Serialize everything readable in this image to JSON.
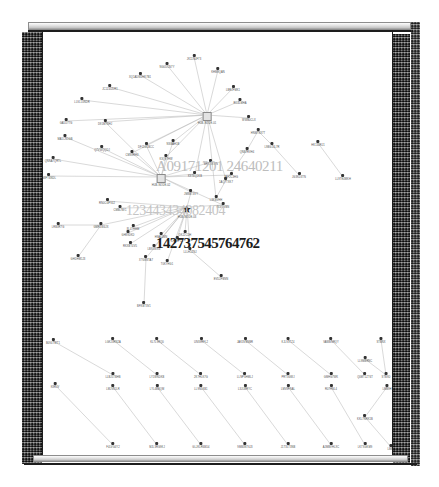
{
  "window": {
    "title": "Graph Visualization",
    "scrollbar_top_name": "horizontal-scrollbar-top",
    "scrollbar_bottom_name": "horizontal-scrollbar-bottom"
  },
  "watermarks": [
    {
      "id": "a",
      "text": "A09171201 24640211"
    },
    {
      "id": "b",
      "text": "123443434082404"
    },
    {
      "id": "c",
      "text": "142737545764762"
    }
  ],
  "graph": {
    "type": "node-link-diagram",
    "canvas": {
      "width": 351,
      "height": 423
    },
    "hubs": [
      {
        "id": "hub1",
        "glyph": "box",
        "x": 164,
        "y": 80,
        "label": "HUB-NODE-01"
      },
      {
        "id": "hub2",
        "glyph": "box",
        "x": 118,
        "y": 142,
        "label": "HUB-NODE-02"
      },
      {
        "id": "hub3",
        "glyph": "star",
        "x": 144,
        "y": 172,
        "label": "HUB-NODE-03"
      }
    ],
    "nodes": [
      {
        "id": "n01",
        "x": 124,
        "y": 30,
        "label": "NG0DCN7Y"
      },
      {
        "id": "n02",
        "x": 151,
        "y": 22,
        "label": "JK11N4F73"
      },
      {
        "id": "n03",
        "x": 97,
        "y": 40,
        "label": "XQ1ADW2HK7B1"
      },
      {
        "id": "n04",
        "x": 175,
        "y": 35,
        "label": "KHM9QAN"
      },
      {
        "id": "n05",
        "x": 67,
        "y": 52,
        "label": "JC1Z4UDR1"
      },
      {
        "id": "n06",
        "x": 190,
        "y": 53,
        "label": "LBRJFMK1"
      },
      {
        "id": "n07",
        "x": 39,
        "y": 65,
        "label": "LLVL10NDR"
      },
      {
        "id": "n08",
        "x": 197,
        "y": 66,
        "label": "RC4LMHA"
      },
      {
        "id": "n09",
        "x": 23,
        "y": 86,
        "label": "GA5D77G"
      },
      {
        "id": "n10",
        "x": 206,
        "y": 83,
        "label": "WWB0CLX"
      },
      {
        "id": "n11",
        "x": 62,
        "y": 87,
        "label": "D91M7NHJ"
      },
      {
        "id": "n12",
        "x": 22,
        "y": 102,
        "label": "MA1CN1GB"
      },
      {
        "id": "n13",
        "x": 130,
        "y": 107,
        "label": "NSBAH1B"
      },
      {
        "id": "n14",
        "x": 103,
        "y": 110,
        "label": "DFJ1G1BCC"
      },
      {
        "id": "n15",
        "x": 59,
        "y": 113,
        "label": "Q7VWQQDJ"
      },
      {
        "id": "n16",
        "x": 89,
        "y": 118,
        "label": "CMS9RH4"
      },
      {
        "id": "n17",
        "x": 123,
        "y": 122,
        "label": "K3Q9THW"
      },
      {
        "id": "n18",
        "x": 10,
        "y": 124,
        "label": "QNNA7QRTL"
      },
      {
        "id": "n19",
        "x": 168,
        "y": 127,
        "label": "BRKDXWN"
      },
      {
        "id": "n20",
        "x": 6,
        "y": 141,
        "label": "N8FT6NDL"
      },
      {
        "id": "n21",
        "x": 152,
        "y": 139,
        "label": "K9T6Q1KB"
      },
      {
        "id": "n22",
        "x": 188,
        "y": 140,
        "label": "JAF2C3HG"
      },
      {
        "id": "n23",
        "x": 148,
        "y": 157,
        "label": "JM8BT3VY"
      },
      {
        "id": "n24",
        "x": 64,
        "y": 166,
        "label": "RN0CGFV4J"
      },
      {
        "id": "n25",
        "x": 180,
        "y": 170,
        "label": "BLVDVBN"
      },
      {
        "id": "n26",
        "x": 77,
        "y": 173,
        "label": "CMBLNV1"
      },
      {
        "id": "n27",
        "x": 15,
        "y": 190,
        "label": "LRB3R7G"
      },
      {
        "id": "n28",
        "x": 58,
        "y": 190,
        "label": "GMR1W4JX"
      },
      {
        "id": "n29",
        "x": 90,
        "y": 192,
        "label": "8L47HHM"
      },
      {
        "id": "n30",
        "x": 85,
        "y": 198,
        "label": "GH89DKD"
      },
      {
        "id": "n31",
        "x": 142,
        "y": 198,
        "label": "DKJ2CDH"
      },
      {
        "id": "n32",
        "x": 118,
        "y": 200,
        "label": "H9A61MN"
      },
      {
        "id": "n33",
        "x": 134,
        "y": 204,
        "label": "CHK8P1Z"
      },
      {
        "id": "n34",
        "x": 87,
        "y": 209,
        "label": "RKXBT4V5"
      },
      {
        "id": "n35",
        "x": 111,
        "y": 212,
        "label": "LB91WXG"
      },
      {
        "id": "n36",
        "x": 147,
        "y": 215,
        "label": "LLLH1ZNJ"
      },
      {
        "id": "n37",
        "x": 103,
        "y": 223,
        "label": "XTG8STA7"
      },
      {
        "id": "n38",
        "x": 124,
        "y": 227,
        "label": "T0KYHG1"
      },
      {
        "id": "n39",
        "x": 35,
        "y": 222,
        "label": "GHDHM1J3"
      },
      {
        "id": "n40",
        "x": 178,
        "y": 242,
        "label": "EVD2FBNN"
      },
      {
        "id": "n41",
        "x": 101,
        "y": 269,
        "label": "BFXBT3V1"
      },
      {
        "id": "n42",
        "x": 215,
        "y": 96,
        "label": "HNMT8X7T"
      },
      {
        "id": "n43",
        "x": 229,
        "y": 110,
        "label": "L9BG13L7R"
      },
      {
        "id": "n44",
        "x": 204,
        "y": 115,
        "label": "QNB7RVH4"
      },
      {
        "id": "n45",
        "x": 183,
        "y": 145,
        "label": "1AQ7TXK7"
      },
      {
        "id": "n46",
        "x": 173,
        "y": 163,
        "label": "L3KBVHH"
      },
      {
        "id": "n47",
        "x": 256,
        "y": 140,
        "label": "JG3KD3TN"
      },
      {
        "id": "n48",
        "x": 275,
        "y": 108,
        "label": "HK134RJ1"
      },
      {
        "id": "n49",
        "x": 300,
        "y": 142,
        "label": "LL9TE4MKH"
      },
      {
        "id": "n50",
        "x": 10,
        "y": 306,
        "label": "B0V4TWT1"
      },
      {
        "id": "n51",
        "x": 70,
        "y": 305,
        "label": "LGKJ3RN2A"
      },
      {
        "id": "n52",
        "x": 114,
        "y": 305,
        "label": "KL7L9RQ0"
      },
      {
        "id": "n53",
        "x": 158,
        "y": 305,
        "label": "UNS9RFL2"
      },
      {
        "id": "n54",
        "x": 202,
        "y": 305,
        "label": "JAK3VBNBR"
      },
      {
        "id": "n55",
        "x": 245,
        "y": 305,
        "label": "KJLV3TZ4"
      },
      {
        "id": "n56",
        "x": 288,
        "y": 305,
        "label": "VAWBNRQY"
      },
      {
        "id": "n57",
        "x": 338,
        "y": 305,
        "label": "STBNX"
      },
      {
        "id": "n58",
        "x": 70,
        "y": 340,
        "label": "LLBJ5TBHB"
      },
      {
        "id": "n59",
        "x": 114,
        "y": 340,
        "label": "LY1WNDKB"
      },
      {
        "id": "n60",
        "x": 158,
        "y": 340,
        "label": "2K7HLK7G"
      },
      {
        "id": "n61",
        "x": 202,
        "y": 340,
        "label": "LLNPSHMLJ"
      },
      {
        "id": "n62",
        "x": 245,
        "y": 340,
        "label": "PRT3GWJ"
      },
      {
        "id": "n63",
        "x": 288,
        "y": 340,
        "label": "GMHG7WK"
      },
      {
        "id": "n64",
        "x": 322,
        "y": 324,
        "label": "LL9MBRNC"
      },
      {
        "id": "n65",
        "x": 322,
        "y": 340,
        "label": "Q0MT1ZT6T"
      },
      {
        "id": "n66",
        "x": 343,
        "y": 340,
        "label": "STB9D"
      },
      {
        "id": "n67",
        "x": 12,
        "y": 350,
        "label": "K8RJV"
      },
      {
        "id": "n68",
        "x": 70,
        "y": 352,
        "label": "LMJV8JLR"
      },
      {
        "id": "n69",
        "x": 114,
        "y": 352,
        "label": "LYL4BBQM"
      },
      {
        "id": "n70",
        "x": 158,
        "y": 352,
        "label": "LL9NLKB1"
      },
      {
        "id": "n71",
        "x": 202,
        "y": 352,
        "label": "L3JLWRYC"
      },
      {
        "id": "n72",
        "x": 245,
        "y": 352,
        "label": "LMV8FNAL"
      },
      {
        "id": "n73",
        "x": 288,
        "y": 352,
        "label": "R07HNL4"
      },
      {
        "id": "n74",
        "x": 344,
        "y": 352,
        "label": "LMB9H"
      },
      {
        "id": "n75",
        "x": 322,
        "y": 382,
        "label": "KKL7NRK1B"
      },
      {
        "id": "n76",
        "x": 70,
        "y": 410,
        "label": "F4LVG4Y2"
      },
      {
        "id": "n77",
        "x": 114,
        "y": 410,
        "label": "MJL3RG9KJ"
      },
      {
        "id": "n78",
        "x": 158,
        "y": 410,
        "label": "GLJKLR6BD4"
      },
      {
        "id": "n79",
        "x": 202,
        "y": 410,
        "label": "9MB3NT6J3"
      },
      {
        "id": "n80",
        "x": 245,
        "y": 410,
        "label": "J1T3LT3NB"
      },
      {
        "id": "n81",
        "x": 288,
        "y": 410,
        "label": "AJMBVHLXC"
      },
      {
        "id": "n82",
        "x": 322,
        "y": 410,
        "label": "LK7XGKM9"
      },
      {
        "id": "n83",
        "x": 348,
        "y": 412,
        "label": "LMB9"
      }
    ],
    "edges": [
      [
        "hub1",
        "n01"
      ],
      [
        "hub1",
        "n02"
      ],
      [
        "hub1",
        "n03"
      ],
      [
        "hub1",
        "n04"
      ],
      [
        "hub1",
        "n05"
      ],
      [
        "hub1",
        "n06"
      ],
      [
        "hub1",
        "n07"
      ],
      [
        "hub1",
        "n08"
      ],
      [
        "hub1",
        "n09"
      ],
      [
        "hub1",
        "n10"
      ],
      [
        "hub1",
        "n11"
      ],
      [
        "hub1",
        "n13"
      ],
      [
        "hub1",
        "n14"
      ],
      [
        "hub1",
        "n16"
      ],
      [
        "hub1",
        "n17"
      ],
      [
        "hub1",
        "n21"
      ],
      [
        "hub1",
        "n45"
      ],
      [
        "hub1",
        "n46"
      ],
      [
        "hub2",
        "n12"
      ],
      [
        "hub2",
        "n15"
      ],
      [
        "hub2",
        "n18"
      ],
      [
        "hub2",
        "n20"
      ],
      [
        "hub2",
        "n11"
      ],
      [
        "hub2",
        "n14"
      ],
      [
        "hub2",
        "n16"
      ],
      [
        "hub2",
        "n17"
      ],
      [
        "hub2",
        "n13"
      ],
      [
        "hub2",
        "n19"
      ],
      [
        "hub2",
        "n21"
      ],
      [
        "hub2",
        "n22"
      ],
      [
        "hub2",
        "n23"
      ],
      [
        "hub2",
        "n25"
      ],
      [
        "hub3",
        "n24"
      ],
      [
        "hub3",
        "n26"
      ],
      [
        "hub3",
        "n28"
      ],
      [
        "hub3",
        "n29"
      ],
      [
        "hub3",
        "n30"
      ],
      [
        "hub3",
        "n31"
      ],
      [
        "hub3",
        "n32"
      ],
      [
        "hub3",
        "n33"
      ],
      [
        "hub3",
        "n34"
      ],
      [
        "hub3",
        "n35"
      ],
      [
        "hub3",
        "n36"
      ],
      [
        "hub3",
        "n37"
      ],
      [
        "hub3",
        "n38"
      ],
      [
        "hub3",
        "n25"
      ],
      [
        "hub3",
        "n23"
      ],
      [
        "n28",
        "n27"
      ],
      [
        "n28",
        "n39"
      ],
      [
        "n37",
        "n41"
      ],
      [
        "n36",
        "n40"
      ],
      [
        "n42",
        "n43"
      ],
      [
        "n42",
        "n44"
      ],
      [
        "n44",
        "n45"
      ],
      [
        "n45",
        "n46"
      ],
      [
        "n43",
        "n47"
      ],
      [
        "n48",
        "n49"
      ],
      [
        "n50",
        "n58"
      ],
      [
        "n51",
        "n59"
      ],
      [
        "n52",
        "n60"
      ],
      [
        "n53",
        "n61"
      ],
      [
        "n54",
        "n62"
      ],
      [
        "n55",
        "n63"
      ],
      [
        "n56",
        "n65"
      ],
      [
        "n57",
        "n66"
      ],
      [
        "n64",
        "n66"
      ],
      [
        "n67",
        "n76"
      ],
      [
        "n68",
        "n77"
      ],
      [
        "n69",
        "n78"
      ],
      [
        "n70",
        "n79"
      ],
      [
        "n71",
        "n80"
      ],
      [
        "n72",
        "n81"
      ],
      [
        "n73",
        "n82"
      ],
      [
        "n74",
        "n75"
      ],
      [
        "n75",
        "n83"
      ]
    ],
    "style": {
      "edge_color": "#b9b9b9",
      "node_color": "#333333",
      "hub_fill": "#e3e3e3",
      "hub_stroke": "#8a8a8a",
      "background": "#ffffff",
      "border_color": "#1d1d1d"
    }
  }
}
